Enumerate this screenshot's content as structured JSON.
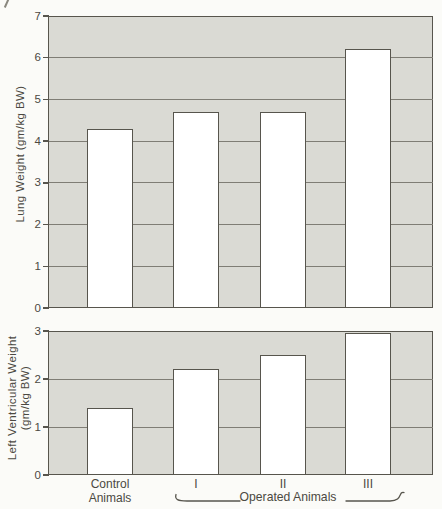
{
  "chart_data": [
    {
      "type": "bar",
      "title": "",
      "categories": [
        "Control Animals",
        "I",
        "II",
        "III"
      ],
      "values": [
        4.3,
        4.7,
        4.7,
        6.2
      ],
      "xlabel": "",
      "ylabel": "Lung Weight (gm/kg BW)",
      "ylabel_lines": [
        "Lung Weight (gm/kg BW)"
      ],
      "ylim": [
        0,
        7
      ],
      "yticks": [
        0,
        1,
        2,
        3,
        4,
        5,
        6,
        7
      ],
      "grid": true,
      "legend": false,
      "bar_fill": "#ffffff",
      "plot_bg": "#dadad4"
    },
    {
      "type": "bar",
      "title": "",
      "categories": [
        "Control Animals",
        "I",
        "II",
        "III"
      ],
      "values": [
        1.4,
        2.2,
        2.5,
        3.0
      ],
      "xlabel": "",
      "ylabel": "Left Ventricular Weight (gm/kg BW)",
      "ylabel_lines": [
        "Left Ventricular Weight",
        "(gm/kg BW)"
      ],
      "ylim": [
        0,
        3
      ],
      "yticks": [
        0,
        1,
        2,
        3
      ],
      "grid": true,
      "legend": false,
      "bar_fill": "#ffffff",
      "plot_bg": "#dadad4"
    }
  ],
  "x_axis": {
    "control_label_lines": [
      "Control",
      "Animals"
    ],
    "operated_numerals": [
      "I",
      "II",
      "III"
    ],
    "group_label": "Operated Animals"
  },
  "colors": {
    "page_bg": "#fbfbf8",
    "plot_bg": "#dadad4",
    "bar_fill": "#ffffff",
    "axis_line": "#57554d",
    "grid_line": "#7f7d75",
    "text": "#4b4942"
  }
}
